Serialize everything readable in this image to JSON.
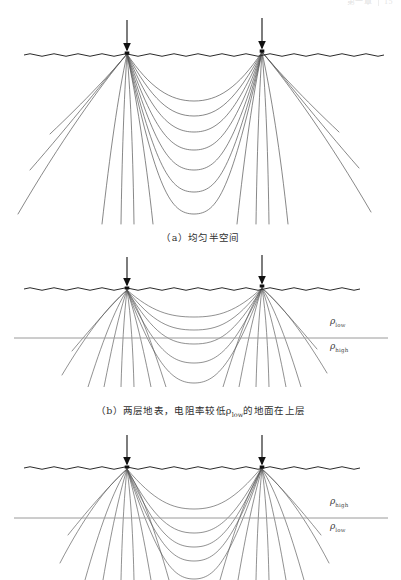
{
  "page": {
    "background": "#ffffff",
    "width": 401,
    "height": 580
  },
  "header": {
    "segments": [
      "第一章",
      "15"
    ]
  },
  "figure": {
    "line_color": "#555555",
    "surface_color": "#2b2b2b",
    "boundary_color": "#9a9a9a",
    "electrode_color": "#111111",
    "panels": [
      {
        "id": "a",
        "label": "(a)",
        "caption": "（a）均匀半空间",
        "kind": "homogeneous-half-space",
        "has_layer_boundary": false,
        "electrodes": [
          {
            "name": "current-electrode-left",
            "x": 127,
            "surface_y": 53
          },
          {
            "name": "current-electrode-right",
            "x": 262,
            "surface_y": 51
          }
        ],
        "flow_line_count": 17,
        "description": "均匀半空间中的电流线分布"
      },
      {
        "id": "b",
        "label": "(b)",
        "caption_parts": {
          "prefix": "（b）两层地表，电阻率较低",
          "symbol": "ρ",
          "subscript": "low",
          "suffix": "的地面在上层"
        },
        "caption": "（b）两层地表，电阻率较低ρlow的地面在上层",
        "kind": "two-layer-conductive-top",
        "has_layer_boundary": true,
        "boundary_y": 338,
        "electrodes": [
          {
            "name": "current-electrode-left",
            "x": 127,
            "surface_y": 288
          },
          {
            "name": "current-electrode-right",
            "x": 262,
            "surface_y": 286
          }
        ],
        "flow_line_count": 19,
        "layers": [
          {
            "position": "upper",
            "symbol": "ρ",
            "subscript": "low",
            "text": "ρlow"
          },
          {
            "position": "lower",
            "symbol": "ρ",
            "subscript": "high",
            "text": "ρhigh"
          }
        ]
      },
      {
        "id": "c",
        "label": "(c)",
        "caption": "",
        "kind": "two-layer-resistive-top",
        "has_layer_boundary": true,
        "boundary_y": 518,
        "electrodes": [
          {
            "name": "current-electrode-left",
            "x": 127,
            "surface_y": 468
          },
          {
            "name": "current-electrode-right",
            "x": 262,
            "surface_y": 466
          }
        ],
        "flow_line_count": 19,
        "layers": [
          {
            "position": "upper",
            "symbol": "ρ",
            "subscript": "high",
            "text": "ρhigh"
          },
          {
            "position": "lower",
            "symbol": "ρ",
            "subscript": "low",
            "text": "ρlow"
          }
        ]
      }
    ]
  },
  "labels": {
    "rho_b_upper_symbol": "ρ",
    "rho_b_upper_sub": "low",
    "rho_b_lower_symbol": "ρ",
    "rho_b_lower_sub": "high",
    "rho_c_upper_symbol": "ρ",
    "rho_c_upper_sub": "high",
    "rho_c_lower_symbol": "ρ",
    "rho_c_lower_sub": "low"
  },
  "captions": {
    "a": "（a）均匀半空间",
    "b_prefix": "（b）两层地表，电阻率较低",
    "b_symbol": "ρ",
    "b_sub": "low",
    "b_suffix": "的地面在上层"
  }
}
